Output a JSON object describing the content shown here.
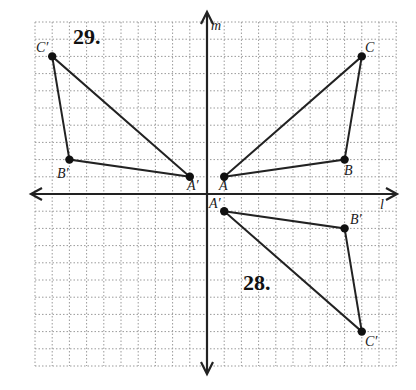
{
  "diagram": {
    "grid": {
      "x_min": -10,
      "x_max": 11,
      "y_min": -10,
      "y_max": 10,
      "unit_px": 17.2,
      "origin_px": [
        207,
        194
      ],
      "line_color": "#9a9a9a",
      "dash": "1.5,2"
    },
    "axes": {
      "vertical": {
        "label": "m",
        "x": 0
      },
      "horizontal": {
        "label": "l",
        "y": 0
      },
      "color": "#222222"
    },
    "original": {
      "points": [
        {
          "name": "A",
          "x": 1,
          "y": 1
        },
        {
          "name": "B",
          "x": 8,
          "y": 2
        },
        {
          "name": "C",
          "x": 9,
          "y": 8
        }
      ]
    },
    "problems": [
      {
        "number": "29.",
        "description": "Reflection in line m",
        "points": [
          {
            "name": "A′",
            "x": -1,
            "y": 1
          },
          {
            "name": "B′",
            "x": -8,
            "y": 2
          },
          {
            "name": "C′",
            "x": -9,
            "y": 8
          }
        ]
      },
      {
        "number": "28.",
        "description": "Reflection in line l",
        "points": [
          {
            "name": "A′",
            "x": 1,
            "y": -1
          },
          {
            "name": "B′",
            "x": 8,
            "y": -2
          },
          {
            "name": "C′",
            "x": 9,
            "y": -8
          }
        ]
      }
    ],
    "labels": {
      "m": "m",
      "l": "l",
      "A": "A",
      "B": "B",
      "C": "C",
      "A29": "A′",
      "B29": "B′",
      "C29": "C′",
      "A28": "A′",
      "B28": "B′",
      "C28": "C′",
      "num29": "29.",
      "num28": "28."
    }
  }
}
